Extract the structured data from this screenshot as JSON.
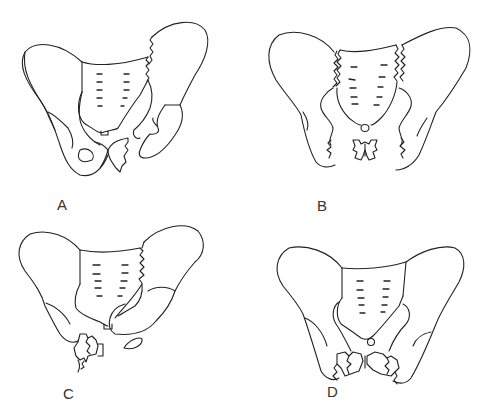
{
  "figure": {
    "panels": [
      {
        "id": "A",
        "label": "A",
        "description": "Pelvis with fracture of the left sacroiliac region (jagged line) and pubic rami fracture"
      },
      {
        "id": "B",
        "label": "B",
        "description": "Pelvis with bilateral sacroiliac disruptions and bilateral pubic rami fractures"
      },
      {
        "id": "C",
        "label": "C",
        "description": "Pelvis with left sacral fracture and ipsilateral right pubic rami fractures"
      },
      {
        "id": "D",
        "label": "D",
        "description": "Pelvis with bilateral pubic rami fractures, intact posterior ring"
      }
    ],
    "line_color": "#222222",
    "background": "#ffffff"
  }
}
